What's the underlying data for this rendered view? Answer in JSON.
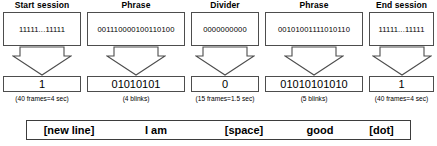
{
  "figure": {
    "columns": [
      {
        "header": "Start session",
        "code": "11111...11111",
        "bits": "1",
        "caption": "(40 frames=4 sec)",
        "word": "[new line]",
        "arrow_icon": "down-block-arrow-icon"
      },
      {
        "header": "Phrase",
        "code": "001110000100110100",
        "bits": "01010101",
        "caption": "(4 blinks)",
        "word": "I am",
        "arrow_icon": "down-block-arrow-icon"
      },
      {
        "header": "Divider",
        "code": "0000000000",
        "bits": "0",
        "caption": "(15 frames=1.5 sec)",
        "word": "[space]",
        "arrow_icon": "down-block-arrow-icon"
      },
      {
        "header": "Phrase",
        "code": "00101001111010110",
        "bits": "01010101010",
        "caption": "(5 blinks)",
        "word": "good",
        "arrow_icon": "down-block-arrow-icon"
      },
      {
        "header": "End session",
        "code": "11111...11111",
        "bits": "1",
        "caption": "(40 frames=4 sec)",
        "word": "[dot]",
        "arrow_icon": "down-block-arrow-icon"
      }
    ],
    "colors": {
      "box_border": "#4d4d4d",
      "bar_border": "#3d3d3d",
      "background": "#ffffff",
      "text": "#000000"
    }
  }
}
